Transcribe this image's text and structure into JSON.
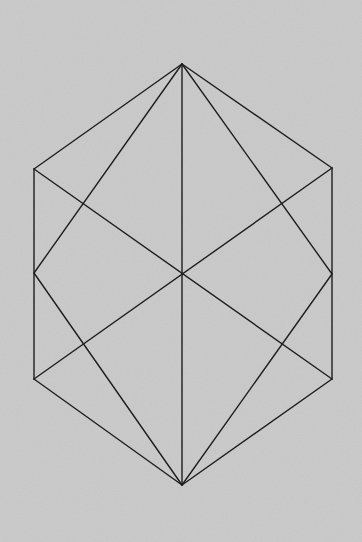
{
  "diagram": {
    "background_color": "#c4c4c4",
    "line_color": "#1e1e1e",
    "vertices": {
      "top": [
        182,
        64
      ],
      "upper_left": [
        34,
        169
      ],
      "mid_left": [
        34,
        273
      ],
      "lower_left": [
        34,
        379
      ],
      "bottom": [
        182,
        485
      ],
      "lower_right": [
        332,
        379
      ],
      "mid_right": [
        332,
        274
      ],
      "upper_right": [
        332,
        168
      ],
      "center": [
        182,
        273
      ]
    },
    "edges": [
      [
        "top",
        "upper_left"
      ],
      [
        "upper_left",
        "lower_left"
      ],
      [
        "lower_left",
        "bottom"
      ],
      [
        "bottom",
        "lower_right"
      ],
      [
        "lower_right",
        "upper_right"
      ],
      [
        "upper_right",
        "top"
      ],
      [
        "top",
        "bottom"
      ],
      [
        "upper_left",
        "lower_right"
      ],
      [
        "upper_right",
        "lower_left"
      ],
      [
        "top",
        "mid_left"
      ],
      [
        "top",
        "mid_right"
      ],
      [
        "bottom",
        "mid_left"
      ],
      [
        "bottom",
        "mid_right"
      ]
    ]
  }
}
